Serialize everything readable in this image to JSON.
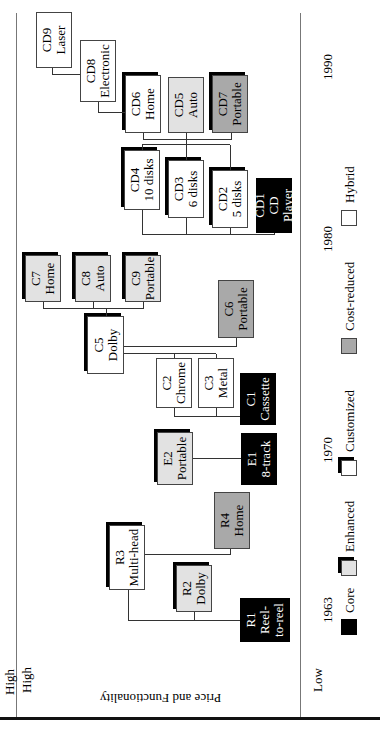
{
  "diagram": {
    "type": "product-family-evolution",
    "orientation_note": "rotated 90deg counter-clockwise in the image",
    "axes": {
      "time": {
        "ticks": [
          "1963",
          "1970",
          "1980",
          "1990"
        ]
      },
      "price_functionality": {
        "label": "Price and Functionality",
        "high": "High",
        "low": "Low"
      }
    },
    "legend": [
      {
        "key": "core",
        "label": "Core",
        "color": "#000000"
      },
      {
        "key": "enhanced",
        "label": "Enhanced",
        "color": "#e2e2e2"
      },
      {
        "key": "customized",
        "label": "Customized",
        "color": "#ffffff"
      },
      {
        "key": "costreduced",
        "label": "Cost-reduced",
        "color": "#a9a9a9"
      },
      {
        "key": "hybrid",
        "label": "Hybrid",
        "color": "#ffffff"
      }
    ],
    "nodes": {
      "R1": {
        "id": "R1",
        "lines": [
          "Reel-",
          "to-reel"
        ],
        "type": "core"
      },
      "R2": {
        "id": "R2",
        "lines": [
          "Dolby"
        ],
        "type": "enhanced"
      },
      "R3": {
        "id": "R3",
        "lines": [
          "Multi-head"
        ],
        "type": "customized"
      },
      "R4": {
        "id": "R4",
        "lines": [
          "Home"
        ],
        "type": "costreduced"
      },
      "E1": {
        "id": "E1",
        "lines": [
          "8-track"
        ],
        "type": "core"
      },
      "E2": {
        "id": "E2",
        "lines": [
          "Portable"
        ],
        "type": "enhanced"
      },
      "C1": {
        "id": "C1",
        "lines": [
          "Cassette"
        ],
        "type": "core"
      },
      "C2": {
        "id": "C2",
        "lines": [
          "Chrome"
        ],
        "type": "hybrid"
      },
      "C3": {
        "id": "C3",
        "lines": [
          "Metal"
        ],
        "type": "hybrid"
      },
      "C5": {
        "id": "C5",
        "lines": [
          "Dolby"
        ],
        "type": "customized"
      },
      "C6": {
        "id": "C6",
        "lines": [
          "Portable"
        ],
        "type": "costreduced"
      },
      "C7": {
        "id": "C7",
        "lines": [
          "Home"
        ],
        "type": "enhanced"
      },
      "C8": {
        "id": "C8",
        "lines": [
          "Auto"
        ],
        "type": "enhanced"
      },
      "C9": {
        "id": "C9",
        "lines": [
          "Portable"
        ],
        "type": "enhanced"
      },
      "CD1": {
        "id": "CD1",
        "lines": [
          "CD",
          "Player"
        ],
        "type": "core"
      },
      "CD2": {
        "id": "CD2",
        "lines": [
          "5 disks"
        ],
        "type": "customized"
      },
      "CD3": {
        "id": "CD3",
        "lines": [
          "6 disks"
        ],
        "type": "customized"
      },
      "CD4": {
        "id": "CD4",
        "lines": [
          "10 disks"
        ],
        "type": "customized"
      },
      "CD5": {
        "id": "CD5",
        "lines": [
          "Auto"
        ],
        "type": "enhanced"
      },
      "CD6": {
        "id": "CD6",
        "lines": [
          "Home"
        ],
        "type": "customized"
      },
      "CD7": {
        "id": "CD7",
        "lines": [
          "Portable"
        ],
        "type": "costreduced"
      },
      "CD8": {
        "id": "CD8",
        "lines": [
          "Electronic"
        ],
        "type": "hybrid"
      },
      "CD9": {
        "id": "CD9",
        "lines": [
          "Laser"
        ],
        "type": "hybrid"
      }
    },
    "edges": [
      [
        "R1",
        "R2"
      ],
      [
        "R1",
        "R3"
      ],
      [
        "R3",
        "R4"
      ],
      [
        "E1",
        "E2"
      ],
      [
        "C1",
        "C2"
      ],
      [
        "C1",
        "C3"
      ],
      [
        "C1",
        "C5"
      ],
      [
        "C5",
        "C6"
      ],
      [
        "C5",
        "C7"
      ],
      [
        "C5",
        "C8"
      ],
      [
        "C5",
        "C9"
      ],
      [
        "CD1",
        "CD2"
      ],
      [
        "CD1",
        "CD3"
      ],
      [
        "CD1",
        "CD4"
      ],
      [
        "CD4",
        "CD5"
      ],
      [
        "CD4",
        "CD6"
      ],
      [
        "CD4",
        "CD7"
      ],
      [
        "CD6",
        "CD8"
      ],
      [
        "CD8",
        "CD9"
      ]
    ]
  }
}
